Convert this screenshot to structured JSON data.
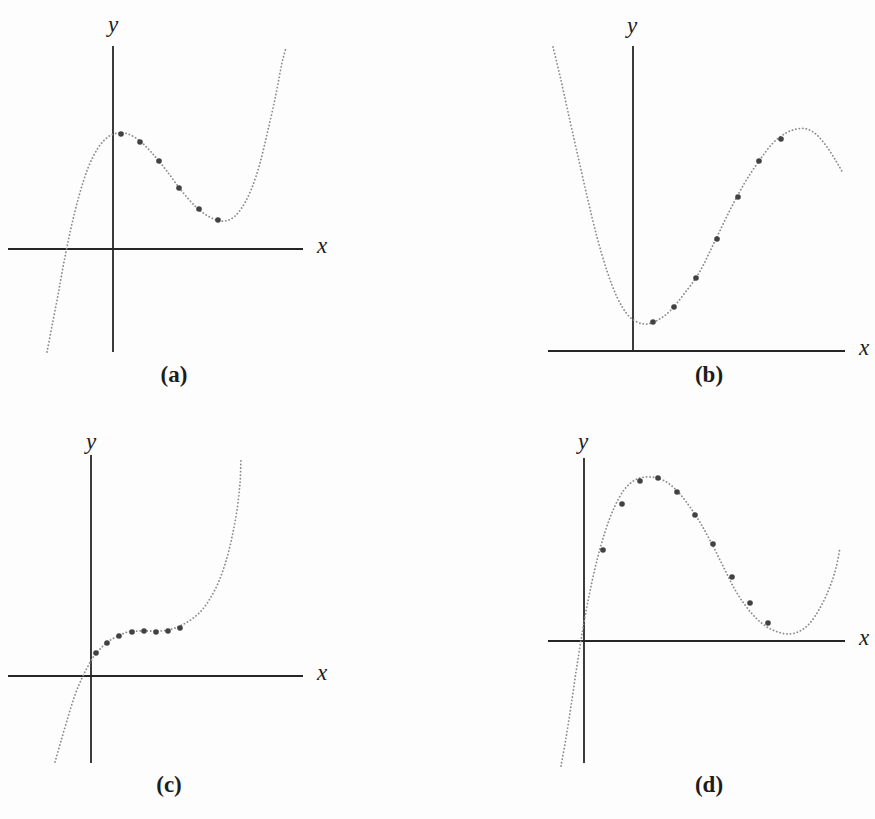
{
  "figure": {
    "width": 875,
    "height": 819,
    "background": "#fdfdfd",
    "axis_color": "#262626",
    "curve_color": "#8c8c8c",
    "point_color": "#424242",
    "label_color": "#1c1c1c",
    "coordinate_space": "screenshot pixels, y increases downward, axes are unlabeled (qualitative sketches)"
  },
  "chart_data": [
    {
      "id": "a",
      "type": "scatter",
      "panel_label": "(a)",
      "xlabel": "x",
      "ylabel": "y",
      "title": "",
      "description": "Cubic-shaped dotted curve rising from lower left, local maximum just right of the y-axis, local minimum mid-panel, then rising steeply; six sample dots run from the maximum down to the minimum.",
      "axes": {
        "y_axis_x": 113,
        "y_axis_top": 46,
        "y_axis_bottom": 352,
        "x_axis_y": 249,
        "x_axis_left": 8,
        "x_axis_right": 303,
        "grid": false
      },
      "labels_px": {
        "ylabel": [
          113,
          24
        ],
        "xlabel": [
          322,
          245
        ],
        "panel": [
          174,
          374
        ]
      },
      "curve_px": [
        [
          47,
          352
        ],
        [
          52,
          326
        ],
        [
          58,
          295
        ],
        [
          64,
          262
        ],
        [
          71,
          228
        ],
        [
          79,
          196
        ],
        [
          88,
          168
        ],
        [
          98,
          148
        ],
        [
          108,
          137
        ],
        [
          118,
          133
        ],
        [
          128,
          134
        ],
        [
          140,
          141
        ],
        [
          152,
          153
        ],
        [
          166,
          170
        ],
        [
          181,
          190
        ],
        [
          196,
          207
        ],
        [
          208,
          216
        ],
        [
          220,
          221
        ],
        [
          231,
          219
        ],
        [
          241,
          209
        ],
        [
          251,
          190
        ],
        [
          260,
          163
        ],
        [
          268,
          130
        ],
        [
          276,
          94
        ],
        [
          282,
          63
        ],
        [
          286,
          48
        ]
      ],
      "points_px": [
        [
          121,
          134
        ],
        [
          140,
          142
        ],
        [
          159,
          161
        ],
        [
          179,
          188
        ],
        [
          199,
          209
        ],
        [
          218,
          220
        ]
      ]
    },
    {
      "id": "b",
      "type": "scatter",
      "panel_label": "(b)",
      "xlabel": "x",
      "ylabel": "y",
      "title": "",
      "description": "Dotted curve descending steeply from upper left to a minimum just right of the y-axis, rising to a local maximum at upper right, then dipping; seven sample dots along the rising portion.",
      "axes": {
        "y_axis_x": 633,
        "y_axis_top": 46,
        "y_axis_bottom": 351,
        "x_axis_y": 351,
        "x_axis_left": 548,
        "x_axis_right": 845,
        "grid": false
      },
      "labels_px": {
        "ylabel": [
          632,
          25
        ],
        "xlabel": [
          864,
          347
        ],
        "panel": [
          709,
          374
        ]
      },
      "curve_px": [
        [
          553,
          47
        ],
        [
          560,
          76
        ],
        [
          568,
          112
        ],
        [
          577,
          152
        ],
        [
          587,
          196
        ],
        [
          597,
          237
        ],
        [
          607,
          271
        ],
        [
          617,
          297
        ],
        [
          627,
          314
        ],
        [
          637,
          322
        ],
        [
          647,
          324
        ],
        [
          658,
          320
        ],
        [
          670,
          311
        ],
        [
          684,
          294
        ],
        [
          699,
          273
        ],
        [
          714,
          243
        ],
        [
          729,
          212
        ],
        [
          744,
          184
        ],
        [
          759,
          161
        ],
        [
          773,
          143
        ],
        [
          786,
          133
        ],
        [
          797,
          129
        ],
        [
          807,
          129
        ],
        [
          817,
          135
        ],
        [
          827,
          147
        ],
        [
          836,
          161
        ],
        [
          843,
          173
        ]
      ],
      "points_px": [
        [
          653,
          322
        ],
        [
          674,
          307
        ],
        [
          696,
          278
        ],
        [
          717,
          239
        ],
        [
          738,
          197
        ],
        [
          759,
          161
        ],
        [
          781,
          139
        ]
      ]
    },
    {
      "id": "c",
      "type": "scatter",
      "panel_label": "(c)",
      "xlabel": "x",
      "ylabel": "y",
      "title": "",
      "description": "Cubic-shaped dotted curve rising from lower left through the origin with a flat inflection plateau just above the x-axis, then rising steeply; eight sample dots clustered along the plateau.",
      "axes": {
        "y_axis_x": 91,
        "y_axis_top": 455,
        "y_axis_bottom": 763,
        "x_axis_y": 676,
        "x_axis_left": 8,
        "x_axis_right": 303,
        "grid": false
      },
      "labels_px": {
        "ylabel": [
          91,
          441
        ],
        "xlabel": [
          322,
          672
        ],
        "panel": [
          169,
          784
        ]
      },
      "curve_px": [
        [
          55,
          762
        ],
        [
          61,
          741
        ],
        [
          68,
          717
        ],
        [
          75,
          695
        ],
        [
          82,
          678
        ],
        [
          88,
          666
        ],
        [
          94,
          656
        ],
        [
          101,
          648
        ],
        [
          109,
          641
        ],
        [
          118,
          636
        ],
        [
          128,
          632
        ],
        [
          139,
          631
        ],
        [
          150,
          631
        ],
        [
          161,
          631
        ],
        [
          172,
          629
        ],
        [
          182,
          625
        ],
        [
          192,
          619
        ],
        [
          202,
          610
        ],
        [
          211,
          597
        ],
        [
          219,
          581
        ],
        [
          226,
          561
        ],
        [
          232,
          537
        ],
        [
          237,
          510
        ],
        [
          240,
          483
        ],
        [
          241,
          458
        ]
      ],
      "points_px": [
        [
          96,
          653
        ],
        [
          107,
          643
        ],
        [
          119,
          636
        ],
        [
          132,
          632
        ],
        [
          144,
          631
        ],
        [
          156,
          632
        ],
        [
          168,
          631
        ],
        [
          180,
          628
        ]
      ]
    },
    {
      "id": "d",
      "type": "scatter",
      "panel_label": "(d)",
      "xlabel": "x",
      "ylabel": "y",
      "title": "",
      "description": "Dotted curve rising steeply from below the x-axis through a point near the origin to a broad maximum, descending to a shallow minimum just above the x-axis at right, then turning upward; ten sample dots from the rise over the maximum down to the minimum.",
      "axes": {
        "y_axis_x": 584,
        "y_axis_top": 458,
        "y_axis_bottom": 763,
        "x_axis_y": 641,
        "x_axis_left": 548,
        "x_axis_right": 845,
        "grid": false
      },
      "labels_px": {
        "ylabel": [
          583,
          441
        ],
        "xlabel": [
          864,
          637
        ],
        "panel": [
          709,
          784
        ]
      },
      "curve_px": [
        [
          561,
          766
        ],
        [
          566,
          738
        ],
        [
          571,
          706
        ],
        [
          576,
          672
        ],
        [
          581,
          640
        ],
        [
          585,
          617
        ],
        [
          590,
          591
        ],
        [
          597,
          560
        ],
        [
          605,
          532
        ],
        [
          614,
          508
        ],
        [
          624,
          490
        ],
        [
          635,
          480
        ],
        [
          646,
          477
        ],
        [
          657,
          478
        ],
        [
          668,
          483
        ],
        [
          679,
          493
        ],
        [
          690,
          507
        ],
        [
          701,
          524
        ],
        [
          712,
          544
        ],
        [
          723,
          566
        ],
        [
          734,
          588
        ],
        [
          745,
          605
        ],
        [
          756,
          618
        ],
        [
          767,
          627
        ],
        [
          778,
          632
        ],
        [
          789,
          634
        ],
        [
          800,
          631
        ],
        [
          810,
          623
        ],
        [
          820,
          608
        ],
        [
          829,
          589
        ],
        [
          836,
          568
        ],
        [
          840,
          548
        ]
      ],
      "points_px": [
        [
          603,
          550
        ],
        [
          622,
          504
        ],
        [
          640,
          481
        ],
        [
          658,
          478
        ],
        [
          677,
          492
        ],
        [
          695,
          515
        ],
        [
          713,
          544
        ],
        [
          732,
          577
        ],
        [
          750,
          603
        ],
        [
          768,
          623
        ]
      ]
    }
  ]
}
